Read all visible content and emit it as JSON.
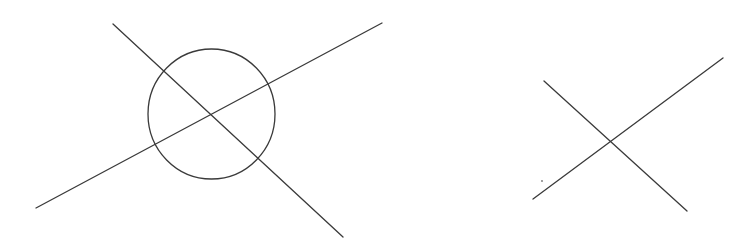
{
  "canvas": {
    "width": 750,
    "height": 247,
    "background": "#ffffff",
    "stroke_color": "#3a3a3a"
  },
  "figures": [
    {
      "name": "circle-with-crossing-lines",
      "circle": {
        "cx": 211.5,
        "cy": 114,
        "rx": 63.5,
        "ry": 65
      },
      "lines": [
        {
          "x1": 113,
          "y1": 24,
          "x2": 343,
          "y2": 237
        },
        {
          "x1": 36,
          "y1": 208,
          "x2": 382,
          "y2": 23
        }
      ]
    },
    {
      "name": "crossing-lines",
      "lines": [
        {
          "x1": 544,
          "y1": 81,
          "x2": 687,
          "y2": 211
        },
        {
          "x1": 533,
          "y1": 199,
          "x2": 723,
          "y2": 58
        }
      ],
      "dot": {
        "cx": 542,
        "cy": 181,
        "r": 0.9
      }
    }
  ]
}
